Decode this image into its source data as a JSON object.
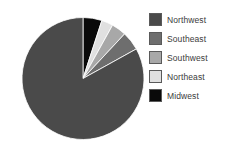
{
  "chart_data": {
    "type": "pie",
    "title": "",
    "subtitle": "",
    "xlabel": "",
    "ylabel": "",
    "grid": false,
    "legend_position": "right",
    "start_angle_deg": 0,
    "direction": "clockwise",
    "categories": [
      "Midwest",
      "Northeast",
      "Southwest",
      "Southeast",
      "Northwest"
    ],
    "values": [
      5,
      3,
      4,
      5,
      83
    ],
    "slices": [
      {
        "label": "Midwest",
        "value": 5,
        "percent": 5,
        "color": "#0a0a0a",
        "start_deg": 0,
        "end_deg": 18
      },
      {
        "label": "Northeast",
        "value": 3,
        "percent": 3,
        "color": "#e0e0e0",
        "start_deg": 18,
        "end_deg": 29
      },
      {
        "label": "Southwest",
        "value": 4,
        "percent": 4,
        "color": "#a8a8a8",
        "start_deg": 29,
        "end_deg": 43
      },
      {
        "label": "Southeast",
        "value": 5,
        "percent": 5,
        "color": "#6e6e6e",
        "start_deg": 43,
        "end_deg": 61
      },
      {
        "label": "Northwest",
        "value": 83,
        "percent": 83,
        "color": "#4a4a4a",
        "start_deg": 61,
        "end_deg": 360
      }
    ]
  },
  "legend": {
    "items": [
      {
        "label": "Northwest",
        "color": "#4a4a4a"
      },
      {
        "label": "Southeast",
        "color": "#6e6e6e"
      },
      {
        "label": "Southwest",
        "color": "#a8a8a8"
      },
      {
        "label": "Northeast",
        "color": "#e0e0e0"
      },
      {
        "label": "Midwest",
        "color": "#0a0a0a"
      }
    ]
  },
  "colors": {
    "background": "#ffffff",
    "text": "#3b3b3b",
    "swatch_border": "#5a5a5a",
    "slice_border": "#ffffff"
  }
}
